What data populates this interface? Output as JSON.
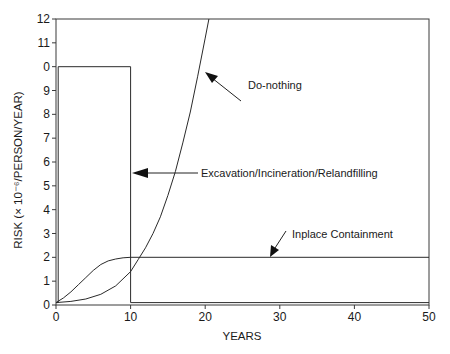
{
  "chart_data": {
    "type": "line",
    "title": "",
    "xlabel": "YEARS",
    "ylabel": "RISK (× 10⁻⁶/PERSON/YEAR)",
    "xlim": [
      0,
      50
    ],
    "ylim": [
      0,
      12
    ],
    "x_ticks": [
      0,
      10,
      20,
      30,
      40,
      50
    ],
    "y_ticks": [
      0,
      1,
      2,
      3,
      4,
      5,
      6,
      7,
      8,
      9,
      10,
      11,
      12
    ],
    "y_tick_labels": [
      "0",
      "1",
      "2",
      "3",
      "4",
      "5",
      "6",
      "7",
      "8",
      "9",
      "0",
      "11",
      "12"
    ],
    "grid": false,
    "legend": "none (inline annotations with arrows)",
    "series": [
      {
        "name": "Do-nothing",
        "x": [
          0,
          2,
          4,
          6,
          8,
          10,
          11,
          12,
          13,
          14,
          15,
          16,
          17,
          18,
          19,
          20,
          20.5
        ],
        "y": [
          0.1,
          0.15,
          0.25,
          0.45,
          0.8,
          1.4,
          1.9,
          2.4,
          3.0,
          3.7,
          4.6,
          5.6,
          6.8,
          8.1,
          9.6,
          11.2,
          12.0
        ]
      },
      {
        "name": "Excavation/Incineration/Relandfilling",
        "x": [
          0,
          0.3,
          0.3,
          10,
          10,
          50
        ],
        "y": [
          0.1,
          0.1,
          10,
          10,
          0.1,
          0.1
        ]
      },
      {
        "name": "Inplace Containment",
        "x": [
          0,
          1,
          2,
          3,
          4,
          5,
          6,
          7,
          8,
          9,
          10,
          50
        ],
        "y": [
          0.1,
          0.3,
          0.55,
          0.85,
          1.15,
          1.45,
          1.7,
          1.85,
          1.93,
          1.98,
          2.0,
          2.0
        ]
      }
    ],
    "annotations": [
      {
        "text": "Do-nothing",
        "target_series": "Do-nothing"
      },
      {
        "text": "Excavation/Incineration/Relandfilling",
        "target_series": "Excavation/Incineration/Relandfilling"
      },
      {
        "text": "Inplace Containment",
        "target_series": "Inplace Containment"
      }
    ]
  },
  "labels": {
    "xlabel": "YEARS",
    "ylabel": "RISK (× 10⁻⁶/PERSON/YEAR)",
    "annot_do_nothing": "Do-nothing",
    "annot_excavation": "Excavation/Incineration/Relandfilling",
    "annot_inplace": "Inplace Containment"
  },
  "colors": {
    "line": "#2a2a2a",
    "axis": "#3a3a3a",
    "background": "#ffffff"
  }
}
